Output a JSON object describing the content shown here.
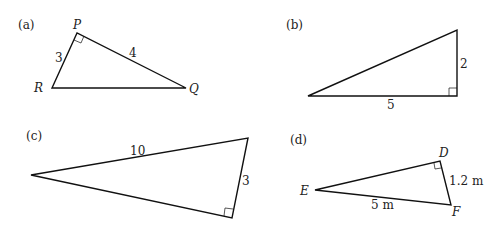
{
  "figures": [
    {
      "label": "(a)",
      "vertices": {
        "P": "P",
        "R": "R",
        "Q": "Q"
      },
      "sides": {
        "PR": "3",
        "PQ": "4"
      },
      "right_angle_at": "P"
    },
    {
      "label": "(b)",
      "sides": {
        "vertical": "2",
        "horizontal": "5"
      },
      "right_angle_at": "bottom-right"
    },
    {
      "label": "(c)",
      "sides": {
        "top": "10",
        "right": "3"
      },
      "right_angle_at": "bottom-right"
    },
    {
      "label": "(d)",
      "vertices": {
        "D": "D",
        "E": "E",
        "F": "F"
      },
      "sides": {
        "DF": "1.2 m",
        "EF": "5 m"
      },
      "right_angle_at": "D"
    }
  ],
  "colors": {
    "line": "#111111",
    "text": "#222222",
    "background": "#ffffff"
  }
}
